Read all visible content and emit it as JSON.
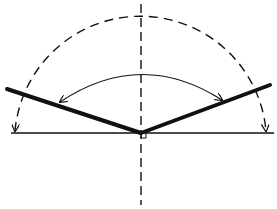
{
  "diagram": {
    "type": "geometric-angle-diagram",
    "colors": {
      "background": "#ffffff",
      "stroke": "#111111"
    },
    "vertex": {
      "x": 141,
      "y": 133
    },
    "baseline": {
      "x1": 11,
      "y1": 133,
      "x2": 274,
      "y2": 133
    },
    "vertical_axis": {
      "x": 141,
      "y1": 4,
      "y2": 205,
      "dashed": true
    },
    "left_bold_line": {
      "x1": 7,
      "y1": 89,
      "x2": 141,
      "y2": 133
    },
    "right_bold_line": {
      "x1": 141,
      "y1": 133,
      "x2": 270,
      "y2": 85
    },
    "dashed_semicircle": {
      "cx": 141,
      "cy": 133,
      "r": 126
    },
    "inner_arc": {
      "start": {
        "x": 60,
        "y": 102
      },
      "peak": {
        "x": 141,
        "y": 73
      },
      "end": {
        "x": 222,
        "y": 100
      },
      "arrowheads": "both"
    },
    "baseline_arrows": [
      {
        "x": 15,
        "y": 131
      },
      {
        "x": 266,
        "y": 131
      }
    ],
    "labels": []
  }
}
